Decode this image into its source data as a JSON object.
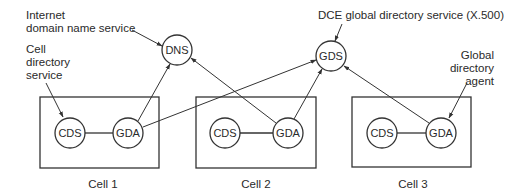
{
  "diagram": {
    "colors": {
      "stroke": "#333333",
      "text": "#2a2a2a",
      "background": "#ffffff"
    },
    "global_nodes": [
      {
        "id": "dns",
        "label": "DNS",
        "cx": 177,
        "cy": 50,
        "r": 15
      },
      {
        "id": "gds",
        "label": "GDS",
        "cx": 331,
        "cy": 56,
        "r": 15
      }
    ],
    "cells": [
      {
        "id": "cell1",
        "label": "Cell 1",
        "box": {
          "x": 40,
          "y": 97,
          "w": 119,
          "h": 71
        },
        "cds": {
          "label": "CDS",
          "cx": 70,
          "cy": 133,
          "r": 15
        },
        "gda": {
          "label": "GDA",
          "cx": 128,
          "cy": 133,
          "r": 15
        }
      },
      {
        "id": "cell2",
        "label": "Cell 2",
        "box": {
          "x": 196,
          "y": 97,
          "w": 120,
          "h": 71
        },
        "cds": {
          "label": "CDS",
          "cx": 225,
          "cy": 133,
          "r": 15
        },
        "gda": {
          "label": "GDA",
          "cx": 288,
          "cy": 133,
          "r": 15
        }
      },
      {
        "id": "cell3",
        "label": "Cell 3",
        "box": {
          "x": 352,
          "y": 97,
          "w": 119,
          "h": 70
        },
        "cds": {
          "label": "CDS",
          "cx": 382,
          "cy": 133,
          "r": 15
        },
        "gda": {
          "label": "GDA",
          "cx": 441,
          "cy": 133,
          "r": 15
        }
      }
    ],
    "annotations": {
      "internet_dns": {
        "line1": "Internet",
        "line2": "domain name service"
      },
      "cell_directory": {
        "line1": "Cell",
        "line2": "directory",
        "line3": "service"
      },
      "dce_gds": {
        "text": "DCE global directory service (X.500)"
      },
      "global_directory_agent": {
        "line1": "Global",
        "line2": "directory",
        "line3": "agent"
      }
    }
  }
}
